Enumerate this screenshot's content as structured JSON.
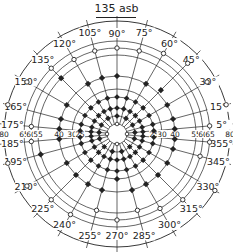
{
  "title": "135 asb",
  "center": {
    "x": 117,
    "y": 134
  },
  "rings": [
    {
      "label": "80",
      "r": 113
    },
    {
      "label": "65",
      "r": 93
    },
    {
      "label": "60",
      "r": 86
    },
    {
      "label": "55",
      "r": 79
    },
    {
      "label": "40",
      "r": 58
    },
    {
      "label": "30",
      "r": 45
    },
    {
      "label": "25",
      "r": 37
    },
    {
      "label": "",
      "r": 26
    },
    {
      "label": "",
      "r": 18
    },
    {
      "label": "",
      "r": 10
    }
  ],
  "ring_axis_labels_left": [
    "80",
    "65",
    "60",
    "55",
    "40",
    "30",
    "25"
  ],
  "ring_axis_labels_right": [
    "25",
    "30",
    "40",
    "55",
    "60",
    "65",
    "80"
  ],
  "angles": [
    90,
    75,
    60,
    45,
    30,
    15,
    5,
    355,
    345,
    330,
    315,
    300,
    285,
    270,
    255,
    240,
    225,
    210,
    195,
    185,
    175,
    165,
    150,
    135,
    120,
    105
  ],
  "angle_labels": [
    "90°",
    "75°",
    "60°",
    "45°",
    "30°",
    "15°",
    "5°",
    "355°",
    "345°",
    "330°",
    "315°",
    "300°",
    "285°",
    "270°",
    "255°",
    "240°",
    "225°",
    "210°",
    "195°",
    "185°",
    "175°",
    "165°",
    "150°",
    "135°",
    "120°",
    "105°"
  ],
  "markers": {
    "open_outer": [
      {
        "angle": 90,
        "r": 86
      },
      {
        "angle": 75,
        "r": 86
      },
      {
        "angle": 60,
        "r": 93
      },
      {
        "angle": 45,
        "r": 100
      },
      {
        "angle": 30,
        "r": 104
      },
      {
        "angle": 15,
        "r": 113
      },
      {
        "angle": 5,
        "r": 93
      },
      {
        "angle": 355,
        "r": 93
      },
      {
        "angle": 345,
        "r": 86
      },
      {
        "angle": 330,
        "r": 113
      },
      {
        "angle": 315,
        "r": 93
      },
      {
        "angle": 300,
        "r": 86
      },
      {
        "angle": 285,
        "r": 79
      },
      {
        "angle": 270,
        "r": 86
      },
      {
        "angle": 255,
        "r": 79
      },
      {
        "angle": 240,
        "r": 93
      },
      {
        "angle": 225,
        "r": 93
      },
      {
        "angle": 210,
        "r": 104
      },
      {
        "angle": 195,
        "r": 113
      },
      {
        "angle": 185,
        "r": 86
      },
      {
        "angle": 175,
        "r": 86
      },
      {
        "angle": 165,
        "r": 113
      },
      {
        "angle": 150,
        "r": 104
      },
      {
        "angle": 135,
        "r": 93
      },
      {
        "angle": 120,
        "r": 86
      },
      {
        "angle": 105,
        "r": 86
      }
    ],
    "filled_mid": [
      {
        "angle": 90,
        "r": 58
      },
      {
        "angle": 60,
        "r": 58
      },
      {
        "angle": 45,
        "r": 62
      },
      {
        "angle": 30,
        "r": 58
      },
      {
        "angle": 15,
        "r": 58
      },
      {
        "angle": 5,
        "r": 58
      },
      {
        "angle": 355,
        "r": 58
      },
      {
        "angle": 345,
        "r": 58
      },
      {
        "angle": 330,
        "r": 58
      },
      {
        "angle": 315,
        "r": 58
      },
      {
        "angle": 300,
        "r": 58
      },
      {
        "angle": 285,
        "r": 58
      },
      {
        "angle": 270,
        "r": 45
      },
      {
        "angle": 255,
        "r": 58
      },
      {
        "angle": 240,
        "r": 58
      },
      {
        "angle": 225,
        "r": 58
      },
      {
        "angle": 210,
        "r": 58
      },
      {
        "angle": 195,
        "r": 79
      },
      {
        "angle": 185,
        "r": 58
      },
      {
        "angle": 175,
        "r": 58
      },
      {
        "angle": 165,
        "r": 58
      },
      {
        "angle": 150,
        "r": 58
      },
      {
        "angle": 135,
        "r": 79
      },
      {
        "angle": 120,
        "r": 58
      },
      {
        "angle": 105,
        "r": 58
      }
    ],
    "filled_inner_rings": [
      37,
      26,
      18
    ],
    "open_center_r": 10
  },
  "colors": {
    "ink": "#222222",
    "background": "#ffffff"
  }
}
